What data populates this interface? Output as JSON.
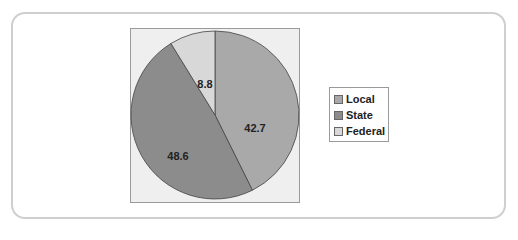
{
  "chart_data": {
    "type": "pie",
    "title": "",
    "categories": [
      "Local",
      "State",
      "Federal"
    ],
    "values": [
      42.7,
      48.6,
      8.8
    ],
    "colors": [
      "#a9a9a9",
      "#8c8c8c",
      "#d8d8d8"
    ],
    "start_angle": "12 o'clock, clockwise",
    "legend_position": "right"
  },
  "legend": {
    "items": [
      {
        "label": "Local",
        "color": "#a9a9a9"
      },
      {
        "label": "State",
        "color": "#8c8c8c"
      },
      {
        "label": "Federal",
        "color": "#d8d8d8"
      }
    ]
  },
  "labels": {
    "local": "42.7",
    "state": "48.6",
    "federal": "8.8"
  }
}
